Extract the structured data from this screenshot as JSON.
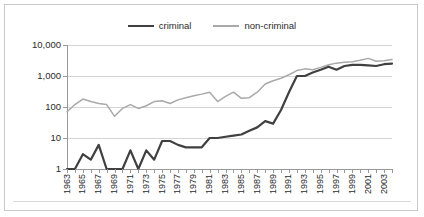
{
  "chart_data": {
    "type": "line",
    "title": "",
    "xlabel": "",
    "ylabel": "",
    "yscale": "log",
    "ylim": [
      1,
      10000
    ],
    "grid": true,
    "legend_position": "top-center",
    "ytick_labels": [
      "10,000",
      "1,000",
      "100",
      "10",
      "1"
    ],
    "ytick_values": [
      10000,
      1000,
      100,
      10,
      1
    ],
    "xtick_labels": [
      "1963",
      "1965",
      "1967",
      "1969",
      "1971",
      "1973",
      "1975",
      "1977",
      "1979",
      "1981",
      "1983",
      "1985",
      "1987",
      "1989",
      "1991",
      "1993",
      "1995",
      "1997",
      "1999",
      "2001",
      "2003"
    ],
    "x": [
      1963,
      1964,
      1965,
      1966,
      1967,
      1968,
      1969,
      1970,
      1971,
      1972,
      1973,
      1974,
      1975,
      1976,
      1977,
      1978,
      1979,
      1980,
      1981,
      1982,
      1983,
      1984,
      1985,
      1986,
      1987,
      1988,
      1989,
      1990,
      1991,
      1992,
      1993,
      1994,
      1995,
      1996,
      1997,
      1998,
      1999,
      2000,
      2001,
      2002,
      2003,
      2004
    ],
    "series": [
      {
        "name": "criminal",
        "color": "#404040",
        "values": [
          1,
          1,
          3,
          2,
          6,
          1,
          1,
          1,
          4,
          1,
          4,
          2,
          8,
          8,
          6,
          5,
          5,
          5,
          10,
          10,
          11,
          12,
          13,
          17,
          22,
          35,
          29,
          80,
          300,
          1000,
          1000,
          1300,
          1600,
          2000,
          1600,
          2100,
          2300,
          2300,
          2200,
          2100,
          2400,
          2500
        ]
      },
      {
        "name": "non-criminal",
        "color": "#a9a9a9",
        "values": [
          70,
          120,
          180,
          150,
          130,
          120,
          50,
          90,
          120,
          90,
          110,
          150,
          160,
          130,
          170,
          200,
          230,
          260,
          300,
          150,
          220,
          300,
          190,
          200,
          300,
          550,
          700,
          850,
          1100,
          1500,
          1700,
          1600,
          1900,
          2300,
          2600,
          2800,
          2900,
          3200,
          3700,
          3000,
          3100,
          3400
        ]
      }
    ]
  },
  "legend": {
    "items": [
      {
        "label": "criminal",
        "key": "criminal"
      },
      {
        "label": "non-criminal",
        "key": "noncriminal"
      }
    ]
  }
}
